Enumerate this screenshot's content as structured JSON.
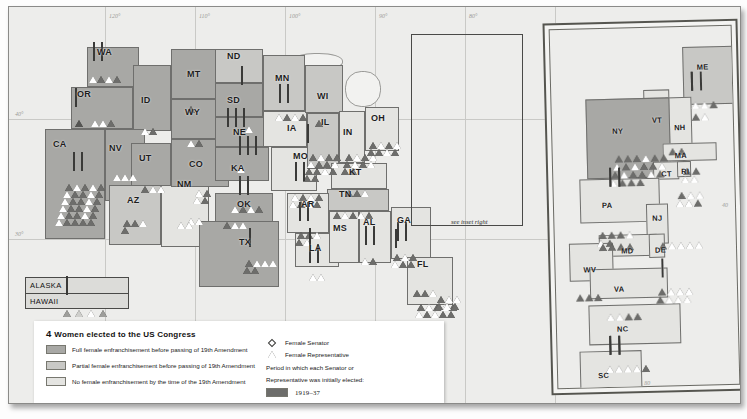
{
  "title": "4 Women elected to the US Congress",
  "legend": {
    "title_lead": "4 ",
    "title_rest": "Women elected to the US Congress",
    "shading": [
      {
        "label": "Full female enfranchisement before passing of 19th Amendment",
        "color": "#a8a8a5"
      },
      {
        "label": "Partial female enfranchisement before passing of 19th Amendment",
        "color": "#c8c8c5"
      },
      {
        "label": "No female enfranchisement by the time of the 19th Amendment",
        "color": "#e4e4e1"
      }
    ],
    "symbols": [
      {
        "shape": "diamond",
        "label": "Female Senator"
      },
      {
        "shape": "triangle",
        "label": "Female Representative"
      }
    ],
    "period_note_line1": "Period in which each Senator or",
    "period_note_line2": "Representative was initially elected:",
    "periods": [
      {
        "label": "1919–37",
        "color": "#6d6d6b"
      },
      {
        "label": "1937–53",
        "color": "#555553"
      },
      {
        "label": "1953–69",
        "color": "#9e9e9b"
      },
      {
        "label": "1969–85",
        "color": "#cfcfcc"
      },
      {
        "label": "1985–98",
        "color": "#ffffff"
      },
      {
        "label": "1999–2009",
        "color": "#7c7c7a"
      }
    ]
  },
  "inset_callout": "see inset right",
  "offshore": {
    "alaska": {
      "name": "ALASKA",
      "symbols": [
        {
          "shape": "diamond",
          "period": 4
        }
      ]
    },
    "hawaii": {
      "name": "HAWAII",
      "symbols": [
        {
          "shape": "triangle",
          "period": 3
        },
        {
          "shape": "triangle",
          "period": 4
        },
        {
          "shape": "triangle",
          "period": 5
        },
        {
          "shape": "triangle",
          "period": 3
        }
      ]
    }
  },
  "graticule": {
    "longitudes": [
      "120°",
      "110°",
      "100°",
      "90°",
      "80°"
    ],
    "latitudes": [
      "40°",
      "30°"
    ],
    "inset_latitude": "40",
    "inset_longitude": "80"
  },
  "states": [
    {
      "abbr": "WA",
      "shade": "full",
      "x": 78,
      "y": 40,
      "w": 52,
      "h": 40,
      "lx": 88,
      "ly": 40
    },
    {
      "abbr": "OR",
      "shade": "full",
      "x": 62,
      "y": 80,
      "w": 62,
      "h": 42,
      "lx": 68,
      "ly": 82
    },
    {
      "abbr": "ID",
      "shade": "full",
      "x": 124,
      "y": 58,
      "w": 38,
      "h": 66,
      "lx": 132,
      "ly": 88
    },
    {
      "abbr": "MT",
      "shade": "full",
      "x": 162,
      "y": 42,
      "w": 62,
      "h": 50,
      "lx": 178,
      "ly": 62
    },
    {
      "abbr": "WY",
      "shade": "full",
      "x": 162,
      "y": 92,
      "w": 54,
      "h": 40,
      "lx": 176,
      "ly": 100
    },
    {
      "abbr": "CA",
      "shade": "full",
      "x": 36,
      "y": 122,
      "w": 60,
      "h": 110,
      "lx": 44,
      "ly": 132
    },
    {
      "abbr": "NV",
      "shade": "full",
      "x": 96,
      "y": 122,
      "w": 40,
      "h": 72,
      "lx": 100,
      "ly": 136
    },
    {
      "abbr": "UT",
      "shade": "full",
      "x": 122,
      "y": 136,
      "w": 40,
      "h": 58,
      "lx": 130,
      "ly": 146
    },
    {
      "abbr": "AZ",
      "shade": "part",
      "x": 100,
      "y": 178,
      "w": 52,
      "h": 60,
      "lx": 118,
      "ly": 188
    },
    {
      "abbr": "NM",
      "shade": "none",
      "x": 152,
      "y": 178,
      "w": 48,
      "h": 62,
      "lx": 168,
      "ly": 172
    },
    {
      "abbr": "CO",
      "shade": "full",
      "x": 162,
      "y": 132,
      "w": 58,
      "h": 48,
      "lx": 180,
      "ly": 152
    },
    {
      "abbr": "ND",
      "shade": "part",
      "x": 206,
      "y": 42,
      "w": 48,
      "h": 34,
      "lx": 218,
      "ly": 44
    },
    {
      "abbr": "SD",
      "shade": "full",
      "x": 206,
      "y": 76,
      "w": 48,
      "h": 34,
      "lx": 218,
      "ly": 88
    },
    {
      "abbr": "NE",
      "shade": "full",
      "x": 206,
      "y": 110,
      "w": 50,
      "h": 30,
      "lx": 224,
      "ly": 120
    },
    {
      "abbr": "KA",
      "shade": "full",
      "x": 206,
      "y": 140,
      "w": 54,
      "h": 34,
      "lx": 222,
      "ly": 156
    },
    {
      "abbr": "OK",
      "shade": "full",
      "x": 206,
      "y": 186,
      "w": 58,
      "h": 34,
      "lx": 228,
      "ly": 192
    },
    {
      "abbr": "TX",
      "shade": "full",
      "x": 190,
      "y": 214,
      "w": 80,
      "h": 66,
      "lx": 230,
      "ly": 230
    },
    {
      "abbr": "MN",
      "shade": "part",
      "x": 254,
      "y": 48,
      "w": 42,
      "h": 56,
      "lx": 266,
      "ly": 66
    },
    {
      "abbr": "IA",
      "shade": "none",
      "x": 254,
      "y": 104,
      "w": 44,
      "h": 36,
      "lx": 278,
      "ly": 116
    },
    {
      "abbr": "MO",
      "shade": "none",
      "x": 262,
      "y": 140,
      "w": 46,
      "h": 44,
      "lx": 284,
      "ly": 144
    },
    {
      "abbr": "WI",
      "shade": "part",
      "x": 296,
      "y": 58,
      "w": 38,
      "h": 48,
      "lx": 308,
      "ly": 84
    },
    {
      "abbr": "IL",
      "shade": "part",
      "x": 298,
      "y": 106,
      "w": 32,
      "h": 56,
      "lx": 312,
      "ly": 110
    },
    {
      "abbr": "IN",
      "shade": "none",
      "x": 330,
      "y": 104,
      "w": 26,
      "h": 52,
      "lx": 334,
      "ly": 120
    },
    {
      "abbr": "OH",
      "shade": "none",
      "x": 356,
      "y": 100,
      "w": 34,
      "h": 44,
      "lx": 362,
      "ly": 106
    },
    {
      "abbr": "KT",
      "shade": "none",
      "x": 322,
      "y": 156,
      "w": 56,
      "h": 26,
      "lx": 340,
      "ly": 160
    },
    {
      "abbr": "TN",
      "shade": "part",
      "x": 318,
      "y": 182,
      "w": 62,
      "h": 22,
      "lx": 330,
      "ly": 182
    },
    {
      "abbr": "AR",
      "shade": "none",
      "x": 278,
      "y": 186,
      "w": 42,
      "h": 40,
      "lx": 292,
      "ly": 192
    },
    {
      "abbr": "LA",
      "shade": "none",
      "x": 286,
      "y": 226,
      "w": 44,
      "h": 34,
      "lx": 300,
      "ly": 236
    },
    {
      "abbr": "MS",
      "shade": "none",
      "x": 320,
      "y": 204,
      "w": 30,
      "h": 52,
      "lx": 324,
      "ly": 216
    },
    {
      "abbr": "AL",
      "shade": "none",
      "x": 350,
      "y": 204,
      "w": 32,
      "h": 52,
      "lx": 354,
      "ly": 210
    },
    {
      "abbr": "GA",
      "shade": "none",
      "x": 382,
      "y": 200,
      "w": 40,
      "h": 52,
      "lx": 388,
      "ly": 208
    },
    {
      "abbr": "FL",
      "shade": "none",
      "x": 398,
      "y": 250,
      "w": 46,
      "h": 48,
      "lx": 408,
      "ly": 252
    }
  ],
  "inset_states": [
    {
      "abbr": "ME",
      "shade": "part",
      "lx": 146,
      "ly": 36
    },
    {
      "abbr": "VT",
      "shade": "none",
      "lx": 100,
      "ly": 88
    },
    {
      "abbr": "NH",
      "shade": "none",
      "lx": 122,
      "ly": 96
    },
    {
      "abbr": "NY",
      "shade": "full",
      "lx": 60,
      "ly": 98
    },
    {
      "abbr": "MA",
      "shade": "none",
      "lx": 122,
      "ly": 124
    },
    {
      "abbr": "CT",
      "shade": "none",
      "lx": 108,
      "ly": 142
    },
    {
      "abbr": "RI",
      "shade": "none",
      "lx": 128,
      "ly": 140
    },
    {
      "abbr": "PA",
      "shade": "none",
      "lx": 48,
      "ly": 172
    },
    {
      "abbr": "NJ",
      "shade": "none",
      "lx": 98,
      "ly": 186
    },
    {
      "abbr": "MD",
      "shade": "none",
      "lx": 66,
      "ly": 218
    },
    {
      "abbr": "DE",
      "shade": "none",
      "lx": 100,
      "ly": 218
    },
    {
      "abbr": "WV",
      "shade": "none",
      "lx": 28,
      "ly": 236
    },
    {
      "abbr": "VA",
      "shade": "none",
      "lx": 58,
      "ly": 256
    },
    {
      "abbr": "NC",
      "shade": "none",
      "lx": 60,
      "ly": 296
    },
    {
      "abbr": "SC",
      "shade": "none",
      "lx": 40,
      "ly": 342
    }
  ]
}
